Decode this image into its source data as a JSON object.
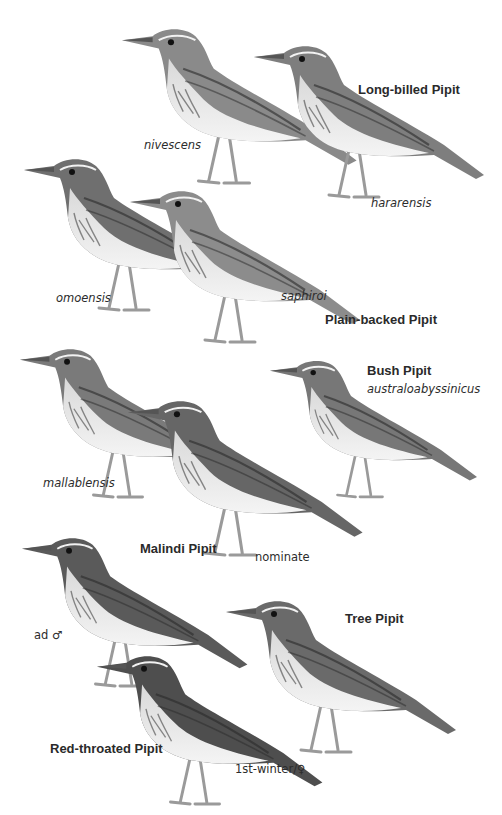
{
  "plate": {
    "background": "#ffffff",
    "species_labels": {
      "long_billed": "Long-billed Pipit",
      "plain_backed": "Plain-backed Pipit",
      "bush": "Bush Pipit",
      "malindi": "Malindi Pipit",
      "tree": "Tree Pipit",
      "red_throated": "Red-throated Pipit"
    },
    "subspecies_labels": {
      "nivescens": "nivescens",
      "hararensis": "hararensis",
      "omoensis": "omoensis",
      "saphiroi": "saphiroi",
      "australoabyssinicus": "australoabyssinicus",
      "mallablensis": "mallablensis",
      "nominate": "nominate"
    },
    "age_sex_labels": {
      "adult_male": "ad ♂",
      "first_winter_female": "1st-winter/♀"
    },
    "birds": [
      {
        "species": "Long-billed Pipit",
        "form": "nivescens",
        "tone": "#8a8a8a"
      },
      {
        "species": "Long-billed Pipit",
        "form": "hararensis",
        "tone": "#7e7e7e"
      },
      {
        "species": "Plain-backed Pipit",
        "form": "omoensis",
        "tone": "#6f6f6f"
      },
      {
        "species": "Plain-backed Pipit",
        "form": "saphiroi",
        "tone": "#8c8c8c"
      },
      {
        "species": "Bush Pipit",
        "form": "australoabyssinicus",
        "tone": "#777777"
      },
      {
        "species": "Malindi Pipit",
        "form": "mallablensis",
        "tone": "#7a7a7a"
      },
      {
        "species": "Malindi Pipit",
        "form": "nominate",
        "tone": "#666666"
      },
      {
        "species": "Red-throated Pipit",
        "form": "ad ♂",
        "tone": "#5a5a5a"
      },
      {
        "species": "Tree Pipit",
        "form": "",
        "tone": "#6a6a6a"
      },
      {
        "species": "Red-throated Pipit",
        "form": "1st-winter/♀",
        "tone": "#4e4e4e"
      }
    ]
  }
}
